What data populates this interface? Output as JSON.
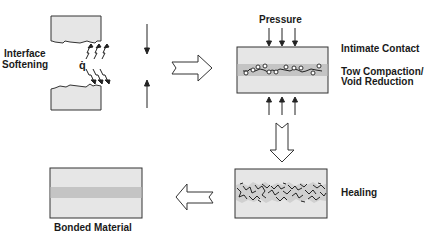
{
  "diagram": {
    "stage1": {
      "label_line1": "Interface",
      "label_line2": "Softening",
      "heat_flux_symbol": "q̇"
    },
    "stage2": {
      "pressure_label": "Pressure",
      "label_intimate_contact": "Intimate Contact",
      "label_tow_line1": "Tow Compaction/",
      "label_tow_line2": "Void Reduction"
    },
    "stage3": {
      "label": "Healing"
    },
    "stage4": {
      "label": "Bonded Material"
    },
    "colors": {
      "panel_fill": "#e6e6e6",
      "band_fill": "#c4c4c4",
      "outline": "#333333",
      "background": "#ffffff"
    },
    "flow": [
      "Interface Softening",
      "Intimate Contact / Tow Compaction / Void Reduction",
      "Healing",
      "Bonded Material"
    ]
  }
}
